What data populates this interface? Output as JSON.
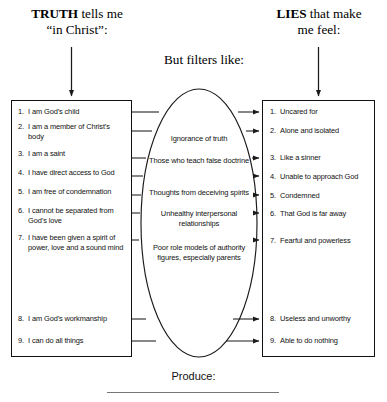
{
  "headers": {
    "truth": {
      "strong": "TRUTH",
      "rest": " tells me",
      "line2": "“in Christ”:"
    },
    "filter": "But filters like:",
    "lies": {
      "strong": "LIES",
      "rest": " that make",
      "line2": "me feel:"
    }
  },
  "truth_list": [
    {
      "num": "1.",
      "text": "I am God’s child"
    },
    {
      "num": "2.",
      "text": "I am a member of Christ’s body"
    },
    {
      "num": "3.",
      "text": "I am a saint"
    },
    {
      "num": "4.",
      "text": "I have direct access to God"
    },
    {
      "num": "5.",
      "text": "I am free of condemnation"
    },
    {
      "num": "6.",
      "text": "I cannot be separated from God’s love"
    },
    {
      "num": "7.",
      "text": "I have been given a spirit of power, love and a sound mind"
    },
    {
      "num": "8.",
      "text": "I am God’s workmanship"
    },
    {
      "num": "9.",
      "text": "I can do all things"
    }
  ],
  "lies_list": [
    {
      "num": "1.",
      "text": "Uncared for"
    },
    {
      "num": "2.",
      "text": "Alone and isolated"
    },
    {
      "num": "3.",
      "text": "Like a sinner"
    },
    {
      "num": "4.",
      "text": "Unable to approach God"
    },
    {
      "num": "5.",
      "text": "Condemned"
    },
    {
      "num": "6.",
      "text": "That God is far away"
    },
    {
      "num": "7.",
      "text": "Fearful and powerless"
    },
    {
      "num": "8.",
      "text": "Useless and unworthy"
    },
    {
      "num": "9.",
      "text": "Able to do nothing"
    }
  ],
  "filters": [
    "Ignorance of truth",
    "Those who teach false doctrine",
    "Thoughts from deceiving spirits",
    "Unhealthy interpersonal relationships",
    "Poor role models of authority figures, especially parents"
  ],
  "footer": {
    "label": "Produce:"
  },
  "colors": {
    "ink": "#111111",
    "rule": "#777777",
    "stroke": "#222222"
  }
}
